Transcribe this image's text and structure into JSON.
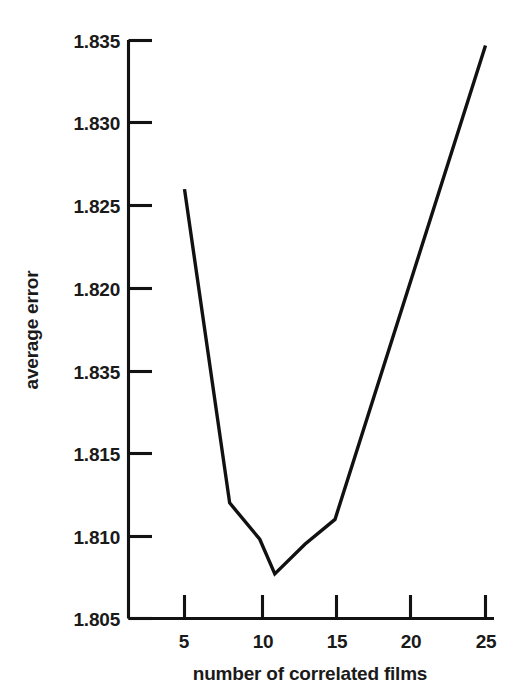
{
  "chart_data": {
    "type": "line",
    "title": "",
    "xlabel": "number of correlated films",
    "ylabel": "average error",
    "xlim": [
      3.2,
      25.6
    ],
    "ylim": [
      1.8,
      1.835
    ],
    "grid": false,
    "legend": null,
    "x_ticks": [
      5,
      10,
      15,
      20,
      25
    ],
    "x_tick_labels": [
      "5",
      "10",
      "15",
      "20",
      "25"
    ],
    "y_ticks": [
      1.8,
      1.805,
      1.81,
      1.815,
      1.82,
      1.825,
      1.83,
      1.835
    ],
    "y_tick_labels": [
      "1.800",
      "1.805",
      "1.810",
      "1.815",
      "1.835",
      "1.820",
      "1.830",
      "1.835"
    ],
    "series": [
      {
        "name": "average error",
        "x": [
          5,
          8,
          10,
          11,
          13,
          15,
          25
        ],
        "values": [
          1.826,
          1.807,
          1.8048,
          1.8027,
          1.8045,
          1.806,
          1.8347
        ]
      }
    ]
  },
  "axes": {
    "y_axis": {
      "label": "average error",
      "ticks": [
        {
          "value": 1.835,
          "label": "1.835"
        },
        {
          "value": 1.83,
          "label": "1.830"
        },
        {
          "value": 1.825,
          "label": "1.825"
        },
        {
          "value": 1.82,
          "label": "1.820"
        },
        {
          "value": 1.815,
          "label": "1.835"
        },
        {
          "value": 1.81,
          "label": "1.815"
        },
        {
          "value": 1.805,
          "label": "1.810"
        },
        {
          "value": 1.8,
          "label": "1.805"
        }
      ]
    },
    "x_axis": {
      "label": "number of correlated films",
      "ticks": [
        {
          "value": 5,
          "label": "5"
        },
        {
          "value": 10,
          "label": "10"
        },
        {
          "value": 15,
          "label": "15"
        },
        {
          "value": 20,
          "label": "20"
        },
        {
          "value": 25,
          "label": "25"
        }
      ]
    }
  },
  "style": {
    "line_color": "#111111",
    "axis_color": "#121212",
    "text_color": "#1a1a1a",
    "background": "#ffffff"
  }
}
